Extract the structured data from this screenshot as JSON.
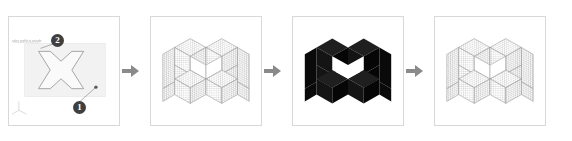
{
  "panels": [
    {
      "id": "panel-sketch",
      "caption": "2D cross profile sketch on work plane",
      "badges": [
        {
          "label": "1",
          "name": "callout-badge-1"
        },
        {
          "label": "2",
          "name": "callout-badge-2"
        }
      ],
      "hint_text": "select profile to extrude",
      "plane_color": "#f2f2f2",
      "outline_color": "#9b9b9b",
      "axis_label": "xyz-axis-triad"
    },
    {
      "id": "panel-mesh-preview",
      "caption": "Isometric wireframe mesh preview",
      "mesh_color": "#8c8c8c",
      "face_color": "#ffffff"
    },
    {
      "id": "panel-shaded-solid",
      "caption": "Shaded solid result",
      "solid_color": "#111111",
      "top_face_color": "#1c1c1c",
      "side_face_color": "#0a0a0a"
    },
    {
      "id": "panel-mesh-final",
      "caption": "Final quad mesh result",
      "mesh_color": "#8c8c8c",
      "face_color": "#ffffff"
    }
  ],
  "arrows": [
    {
      "name": "arrow-step-1-to-2",
      "glyph": "right-arrow"
    },
    {
      "name": "arrow-step-2-to-3",
      "glyph": "right-arrow"
    },
    {
      "name": "arrow-step-3-to-4",
      "glyph": "right-arrow"
    }
  ],
  "colors": {
    "frame": "#d8d8d8",
    "arrow": "#8a8a8a",
    "badge": "#3f3f3f",
    "background": "#ffffff"
  }
}
